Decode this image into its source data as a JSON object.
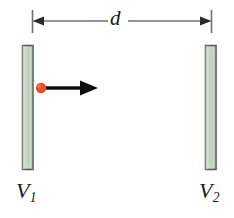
{
  "figure": {
    "name": "parallel-plate-potential-difference-diagram",
    "background_color": "#ffffff",
    "width": 234,
    "height": 218
  },
  "dimension": {
    "label": "d",
    "description": "separation between the two plates",
    "line_color": "#2b2b2b",
    "tick_color": "#6e6e78",
    "y": 21,
    "left_tick_x": 32,
    "right_tick_x": 211
  },
  "plates": [
    {
      "id": "plate-left",
      "label": "V",
      "subscript": "1",
      "fill_color": "#c3d3c0",
      "edge_color": "#4a554a",
      "x": 22,
      "y": 45,
      "width": 11,
      "height": 125
    },
    {
      "id": "plate-right",
      "label": "V",
      "subscript": "2",
      "fill_color": "#c3d3c0",
      "edge_color": "#4a554a",
      "x": 205,
      "y": 45,
      "width": 11,
      "height": 125
    }
  ],
  "particle": {
    "name": "charged-particle",
    "color": "#f04a20",
    "cx": 41,
    "cy": 88,
    "r": 5
  },
  "velocity_arrow": {
    "name": "velocity-arrow",
    "color": "#0d0d0d",
    "direction": "right",
    "x_start": 46,
    "x_end": 98,
    "y": 88
  }
}
